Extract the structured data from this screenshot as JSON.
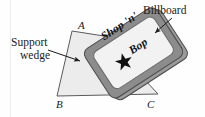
{
  "figure": {
    "type": "statics-diagram",
    "background_color": "#fefefe",
    "margin_rule_color": "#e8e8e8"
  },
  "callouts": {
    "billboard": {
      "label": "Billboard",
      "leader": "arrow-down-left"
    },
    "support_wedge": {
      "line1": "Support",
      "line2": "wedge",
      "leader": "arrow-right"
    }
  },
  "vertices": [
    {
      "id": "A",
      "label": "A",
      "position": "top-left-apex"
    },
    {
      "id": "B",
      "label": "B",
      "position": "bottom-left"
    },
    {
      "id": "C",
      "label": "C",
      "position": "bottom-right"
    }
  ],
  "billboard_sign": {
    "line1": "Shop 'n'",
    "line2": "Bop",
    "emblem": "star-icon",
    "frame_color": "#8c8c8c",
    "panel_color": "#f2f2f2",
    "star_color": "#111111"
  },
  "wedge": {
    "fill_color": "#ececec",
    "edge_color": "#555555"
  }
}
